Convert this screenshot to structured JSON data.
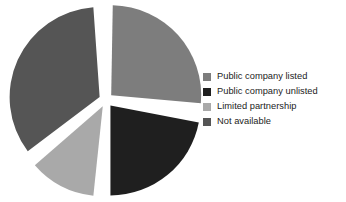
{
  "chart_data": {
    "type": "pie",
    "title": "",
    "subtitle": "",
    "xlabel": "",
    "ylabel": "",
    "exploded": true,
    "grid": false,
    "legend_position": "right",
    "categories": [
      "Public company listed",
      "Public company unlisted",
      "Limited partnership",
      "Not available"
    ],
    "values": [
      26,
      22,
      12,
      35
    ],
    "colors": [
      "#7d7d7d",
      "#1f1f1f",
      "#a9a9a9",
      "#555555"
    ],
    "slices": [
      {
        "label": "Public company listed",
        "value": 26,
        "color": "#7d7d7d",
        "start_angle": 1,
        "end_angle": 95,
        "position": "top-right"
      },
      {
        "label": "Public company unlisted",
        "value": 22,
        "color": "#1f1f1f",
        "start_angle": 101,
        "end_angle": 180,
        "position": "bottom-right"
      },
      {
        "label": "Limited partnership",
        "value": 12,
        "color": "#a9a9a9",
        "start_angle": 186,
        "end_angle": 229,
        "position": "bottom-left"
      },
      {
        "label": "Not available",
        "value": 35,
        "color": "#555555",
        "start_angle": 233,
        "end_angle": 356,
        "position": "left"
      }
    ]
  },
  "legend": {
    "items": [
      {
        "label": "Public company listed",
        "color": "#7d7d7d"
      },
      {
        "label": "Public company unlisted",
        "color": "#1f1f1f"
      },
      {
        "label": "Limited partnership",
        "color": "#a9a9a9"
      },
      {
        "label": "Not available",
        "color": "#555555"
      }
    ]
  }
}
